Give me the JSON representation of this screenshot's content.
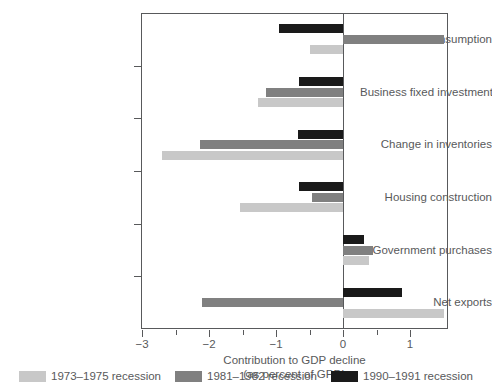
{
  "chart_data": {
    "type": "bar",
    "orientation": "horizontal",
    "title": "",
    "xlabel_line1": "Contribution to GDP decline",
    "xlabel_line2": "(as percent of GPD)",
    "ylabel": "",
    "xlim": [
      -3.3,
      1.65
    ],
    "xticks": [
      -3,
      -2,
      -1,
      0,
      1
    ],
    "xticklabels": [
      "−3",
      "−2",
      "−1",
      "0",
      "1"
    ],
    "grid": false,
    "legend_position": "bottom",
    "categories": [
      "Personal consumption",
      "Business fixed investment",
      "Change in inventories",
      "Housing construction",
      "Government purchases",
      "Net exports"
    ],
    "series": [
      {
        "name": "1973–1975 recession",
        "color": "#c8c8c8",
        "values": [
          -0.5,
          -1.27,
          -2.7,
          -1.53,
          0.39,
          1.5
        ]
      },
      {
        "name": "1981–1982 recession",
        "color": "#808080",
        "values": [
          1.5,
          -1.15,
          -2.13,
          -0.46,
          0.45,
          -2.1
        ]
      },
      {
        "name": "1990–1991 recession",
        "color": "#1a1a1a",
        "values": [
          -0.95,
          -0.65,
          -0.67,
          -0.65,
          0.31,
          0.88
        ]
      }
    ]
  },
  "legend": {
    "items": [
      {
        "label": "1973–1975 recession",
        "color": "#c8c8c8"
      },
      {
        "label": "1981–1982 recession",
        "color": "#808080"
      },
      {
        "label": "1990–1991 recession",
        "color": "#1a1a1a"
      }
    ]
  },
  "axis": {
    "xlabel_line1": "Contribution to GDP decline",
    "xlabel_line2": "(as percent of GPD)"
  }
}
